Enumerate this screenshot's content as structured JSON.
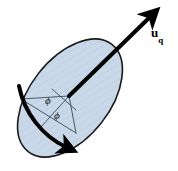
{
  "figure": {
    "type": "vector-plane-diagram",
    "background_color": "#ffffff",
    "disc": {
      "name": "inclined-circular-plane",
      "fill_color": "#c9d8e9",
      "stroke_color": "#1a1a1a",
      "stroke_width": 1.6,
      "center_x": 70,
      "center_y": 98,
      "radius_x": 40,
      "radius_y": 68,
      "rotation_deg": 38,
      "hatch_color": "#b9cbe0"
    },
    "vector": {
      "name": "u_q",
      "label_main": "u",
      "label_subscript": "q",
      "label_full": "u_q",
      "color": "#000000",
      "stroke_width": 4,
      "start_x": 69,
      "start_y": 96,
      "end_x": 154,
      "end_y": 13,
      "label_x": 152,
      "label_y": 26
    },
    "arc_arrow": {
      "name": "tangential-direction-arrow",
      "color": "#000000",
      "stroke_width": 4,
      "description": "thick arrow along lower-left rim of the disc pointing down-right"
    },
    "angles": [
      {
        "name": "phi-upper",
        "symbol": "ϕ",
        "x": 45,
        "y": 100
      },
      {
        "name": "phi-lower",
        "symbol": "ϕ",
        "x": 54,
        "y": 115
      }
    ],
    "guide_lines": {
      "color": "#2b3a4a",
      "stroke_width": 0.8
    }
  }
}
